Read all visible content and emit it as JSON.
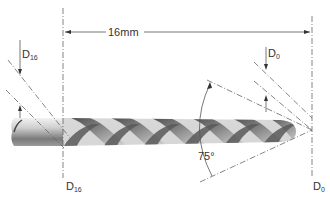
{
  "diagram": {
    "length_label": "16mm",
    "angle_label": "75°",
    "labels": {
      "d16_top": {
        "main": "D",
        "sub": "16"
      },
      "d16_bottom": {
        "main": "D",
        "sub": "16"
      },
      "d0_top": {
        "main": "D",
        "sub": "0"
      },
      "d0_bottom": {
        "main": "D",
        "sub": "0"
      }
    },
    "colors": {
      "line": "#555555",
      "shank_light": "#e6e6e6",
      "shank_dark": "#6a6a6a",
      "flute_dark": "#4a4a4a",
      "flute_light": "#cfcfcf"
    }
  }
}
